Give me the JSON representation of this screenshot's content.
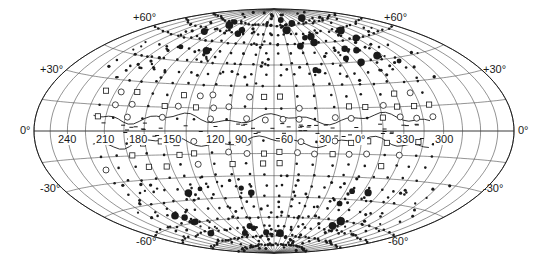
{
  "chart_data": {
    "type": "scatter",
    "title": "",
    "projection": "Hammer-Aitoff, galactic coordinates",
    "xlabel": "Galactic longitude",
    "ylabel": "Galactic latitude",
    "lat_labels_left": [
      {
        "text": "+60°",
        "lat": 60
      },
      {
        "text": "+30°",
        "lat": 30
      },
      {
        "text": "0°",
        "lat": 0
      },
      {
        "text": "-30°",
        "lat": -30
      },
      {
        "text": "-60°",
        "lat": -60
      }
    ],
    "lat_labels_right": [
      {
        "text": "+60°",
        "lat": 60
      },
      {
        "text": "+30°",
        "lat": 30
      },
      {
        "text": "0°",
        "lat": 0
      },
      {
        "text": "-30°",
        "lat": -30
      },
      {
        "text": "-60°",
        "lat": -60
      }
    ],
    "lon_labels": [
      "240",
      "210",
      "180",
      "150",
      "120",
      "90",
      "60",
      "30",
      "0°",
      "330",
      "300"
    ],
    "lon_label_values": [
      240,
      210,
      180,
      150,
      120,
      90,
      60,
      30,
      0,
      330,
      300
    ],
    "grid": {
      "lat_step": 15,
      "lon_step": 15
    },
    "marker_types": [
      {
        "name": "small filled dot",
        "symbol": "dot"
      },
      {
        "name": "large filled dot",
        "symbol": "big-dot"
      },
      {
        "name": "open circle",
        "symbol": "circle"
      },
      {
        "name": "open square",
        "symbol": "square"
      }
    ]
  },
  "colors": {
    "ink": "#1a1a1a",
    "grid": "#3a3a3a",
    "background": "#ffffff"
  }
}
